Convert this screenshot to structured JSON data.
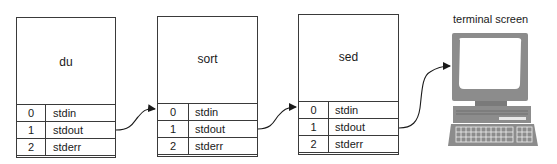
{
  "diagram": {
    "processes": [
      {
        "name": "du",
        "fds": [
          {
            "num": "0",
            "label": "stdin"
          },
          {
            "num": "1",
            "label": "stdout"
          },
          {
            "num": "2",
            "label": "stderr"
          }
        ]
      },
      {
        "name": "sort",
        "fds": [
          {
            "num": "0",
            "label": "stdin"
          },
          {
            "num": "1",
            "label": "stdout"
          },
          {
            "num": "2",
            "label": "stderr"
          }
        ]
      },
      {
        "name": "sed",
        "fds": [
          {
            "num": "0",
            "label": "stdin"
          },
          {
            "num": "1",
            "label": "stdout"
          },
          {
            "num": "2",
            "label": "stderr"
          }
        ]
      }
    ],
    "terminal": {
      "label": "terminal screen",
      "icon": "computer-terminal-icon"
    },
    "connections": [
      {
        "from": "du.stdout",
        "to": "sort.stdin"
      },
      {
        "from": "sort.stdout",
        "to": "sed.stdin"
      },
      {
        "from": "sed.stdout",
        "to": "terminal screen"
      }
    ],
    "colors": {
      "line": "#3a3a3a",
      "terminal_body": "#8c8c8c",
      "terminal_dark": "#6e6e6e",
      "screen": "#ffffff"
    }
  }
}
